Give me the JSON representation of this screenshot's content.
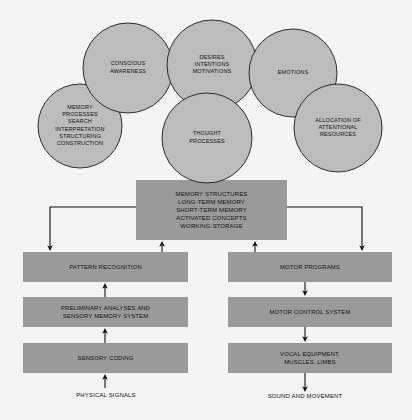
{
  "figure": {
    "background_color": "#f4f4f2",
    "circle_fill": "#bcbcbc",
    "circle_stroke": "#1a1a1a",
    "box_fill": "#9a9a9a",
    "text_color": "#111111",
    "connector_color": "#111111"
  },
  "circles": [
    {
      "id": "memory-processes",
      "cx": 80,
      "cy": 126,
      "r": 42,
      "lines": [
        "MEMORY",
        "PROCESSES",
        "SEARCH",
        "INTERPRETATION",
        "STRUCTURING",
        "CONSTRUCTION"
      ]
    },
    {
      "id": "conscious-awareness",
      "cx": 128,
      "cy": 68,
      "r": 45,
      "lines": [
        "CONSCIOUS",
        "AWARENESS"
      ]
    },
    {
      "id": "desires-intentions-motivations",
      "cx": 212,
      "cy": 65,
      "r": 45,
      "lines": [
        "DESIRES",
        "INTENTIONS",
        "MOTIVATIONS"
      ]
    },
    {
      "id": "emotions",
      "cx": 293,
      "cy": 73,
      "r": 44,
      "lines": [
        "EMOTIONS"
      ]
    },
    {
      "id": "allocation-of-attentional-resources",
      "cx": 338,
      "cy": 128,
      "r": 44,
      "lines": [
        "ALLOCATION OF",
        "ATTENTIONAL",
        "RESOURCES"
      ]
    },
    {
      "id": "thought-processes",
      "cx": 207,
      "cy": 138,
      "r": 45,
      "lines": [
        "THOUGHT",
        "PROCESSES"
      ]
    }
  ],
  "boxes": [
    {
      "id": "memory-structures",
      "x": 136,
      "y": 180,
      "width": 151,
      "height": 60,
      "lines": [
        "MEMORY STRUCTURES",
        "LONG-TERM MEMORY",
        "SHORT-TERM MEMORY",
        "ACTIVATED CONCEPTS",
        "WORKING STORAGE"
      ]
    },
    {
      "id": "pattern-recognition",
      "x": 23,
      "y": 252,
      "width": 165,
      "height": 30,
      "lines": [
        "PATTERN RECOGNITION"
      ]
    },
    {
      "id": "preliminary-analyses",
      "x": 23,
      "y": 297,
      "width": 165,
      "height": 30,
      "lines": [
        "PRELIMINARY ANALYSES AND",
        "SENSORY MEMORY SYSTEM"
      ]
    },
    {
      "id": "sensory-coding",
      "x": 23,
      "y": 343,
      "width": 165,
      "height": 30,
      "lines": [
        "SENSORY CODING"
      ]
    },
    {
      "id": "motor-programs",
      "x": 228,
      "y": 252,
      "width": 164,
      "height": 30,
      "lines": [
        "MOTOR PROGRAMS"
      ]
    },
    {
      "id": "motor-control-system",
      "x": 228,
      "y": 297,
      "width": 164,
      "height": 30,
      "lines": [
        "MOTOR CONTROL SYSTEM"
      ]
    },
    {
      "id": "vocal-equipment",
      "x": 228,
      "y": 343,
      "width": 164,
      "height": 30,
      "lines": [
        "VOCAL EQUIPMENT,",
        "MUSCLES, LIMBS"
      ]
    }
  ],
  "captions": [
    {
      "id": "physical-signals",
      "x": 106,
      "y": 395,
      "label": "PHYSICAL SIGNALS"
    },
    {
      "id": "sound-and-movement",
      "x": 305,
      "y": 396,
      "label": "SOUND AND MOVEMENT"
    }
  ],
  "connectors": [
    {
      "id": "memory-to-pattern-recognition",
      "from": "memory-structures",
      "to": "pattern-recognition",
      "direction": "down"
    },
    {
      "id": "memory-to-motor-programs",
      "from": "memory-structures",
      "to": "motor-programs",
      "direction": "down"
    },
    {
      "id": "pattern-recognition-to-memory",
      "from": "pattern-recognition",
      "to": "memory-structures",
      "direction": "up"
    },
    {
      "id": "motor-programs-to-memory",
      "from": "motor-programs",
      "to": "memory-structures",
      "direction": "up"
    },
    {
      "id": "preliminary-to-pattern-recognition",
      "from": "preliminary-analyses",
      "to": "pattern-recognition",
      "direction": "up"
    },
    {
      "id": "sensory-coding-to-preliminary",
      "from": "sensory-coding",
      "to": "preliminary-analyses",
      "direction": "up"
    },
    {
      "id": "physical-signals-to-sensory-coding",
      "from": "physical-signals",
      "to": "sensory-coding",
      "direction": "up"
    },
    {
      "id": "motor-programs-to-motor-control",
      "from": "motor-programs",
      "to": "motor-control-system",
      "direction": "down"
    },
    {
      "id": "motor-control-to-vocal-equipment",
      "from": "motor-control-system",
      "to": "vocal-equipment",
      "direction": "down"
    },
    {
      "id": "vocal-equipment-to-sound",
      "from": "vocal-equipment",
      "to": "sound-and-movement",
      "direction": "down"
    }
  ]
}
